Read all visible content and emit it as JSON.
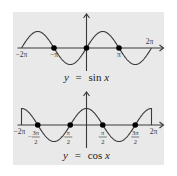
{
  "chart_data": [
    {
      "type": "line",
      "title": "y = sin x",
      "function": "sin",
      "xlim_pi": [
        -2,
        2
      ],
      "ylim": [
        -1,
        1
      ],
      "grid": false,
      "x_ticks": [
        {
          "value_pi": -2,
          "label": "−2π"
        },
        {
          "value_pi": -1,
          "label": "−π"
        },
        {
          "value_pi": 1,
          "label": "π"
        },
        {
          "value_pi": 2,
          "label": "2π"
        }
      ],
      "marked_zeros_pi": [
        -1,
        0,
        1
      ],
      "label": {
        "y": "y",
        "eq": "=",
        "fn": "sin",
        "x": "x"
      }
    },
    {
      "type": "line",
      "title": "y = cos x",
      "function": "cos",
      "xlim_pi": [
        -2,
        2
      ],
      "ylim": [
        -1,
        1
      ],
      "grid": false,
      "x_ticks": [
        {
          "value_pi": -2,
          "label": "−2π"
        },
        {
          "value_pi": -1.5,
          "num": "3π",
          "den": "2",
          "sign": "−"
        },
        {
          "value_pi": -0.5,
          "num": "π",
          "den": "2",
          "sign": "−"
        },
        {
          "value_pi": 0.5,
          "num": "π",
          "den": "2",
          "sign": ""
        },
        {
          "value_pi": 1.5,
          "num": "3π",
          "den": "2",
          "sign": ""
        },
        {
          "value_pi": 2,
          "label": "2π"
        }
      ],
      "marked_zeros_pi": [
        -1.5,
        -0.5,
        0.5,
        1.5
      ],
      "label": {
        "y": "y",
        "eq": "=",
        "fn": "cos",
        "x": "x"
      }
    }
  ]
}
